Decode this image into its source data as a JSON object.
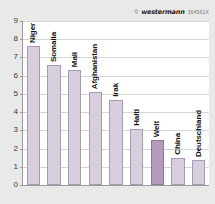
{
  "credit": {
    "symbol": "©",
    "publisher": "westermann",
    "code": "364561X"
  },
  "chart_data": {
    "type": "bar",
    "title": "",
    "xlabel": "",
    "ylabel": "",
    "ylim": [
      0,
      9
    ],
    "yticks": [
      "0",
      "1",
      "2",
      "3",
      "4",
      "5",
      "6",
      "7",
      "8",
      "9"
    ],
    "grid": true,
    "legend": "none",
    "categories": [
      "Niger",
      "Somalia",
      "Mali",
      "Afghanistan",
      "Irak",
      "Haiti",
      "Welt",
      "China",
      "Deutschland"
    ],
    "values": [
      7.65,
      6.6,
      6.3,
      5.1,
      4.65,
      3.1,
      2.45,
      1.5,
      1.35
    ],
    "highlight_category": "Welt",
    "colors": {
      "bar": "#d8cede",
      "bar_border": "#a89bb0",
      "bar_highlight": "#b59bbd",
      "bar_highlight_border": "#8e7798",
      "background": "#e9e9e9",
      "plot_background": "#ffffff",
      "axis": "#9a9a9a",
      "gridline": "#d5d5d5",
      "text": "#141414"
    }
  }
}
